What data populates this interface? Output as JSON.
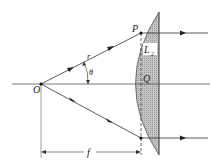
{
  "diagram": {
    "labels": {
      "point_o": "O",
      "point_p": "P",
      "point_q": "Q",
      "radius": "r",
      "angle": "θ",
      "lens": "L",
      "lens_sub": "2",
      "focal_length": "f"
    },
    "colors": {
      "line": "#333333",
      "lens_fill": "#b8b8b8",
      "background": "#ffffff"
    }
  }
}
